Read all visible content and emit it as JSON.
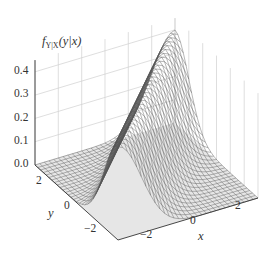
{
  "chart_data": {
    "type": "surface3d",
    "title": "",
    "zlabel": "f_{Y|X}(y|x)",
    "zlabel_parts": {
      "f": "f",
      "sub": "Y|X",
      "args": "(y|x)"
    },
    "xlabel": "x",
    "ylabel": "y",
    "x_ticks": [
      "−2",
      "0",
      "2"
    ],
    "y_ticks": [
      "2",
      "0",
      "−2"
    ],
    "z_ticks": [
      "0.0",
      "0.1",
      "0.2",
      "0.3",
      "0.4"
    ],
    "xlim": [
      -3,
      3
    ],
    "ylim": [
      -3,
      3
    ],
    "zlim": [
      0,
      0.45
    ],
    "surface": {
      "function": "normal_pdf(y - x)",
      "peak": 0.4,
      "grid_n": 30
    },
    "colors": {
      "mesh": "#555555",
      "floor": "#e6e6e6",
      "grid": "#d0d0d0",
      "axis": "#333333"
    }
  }
}
